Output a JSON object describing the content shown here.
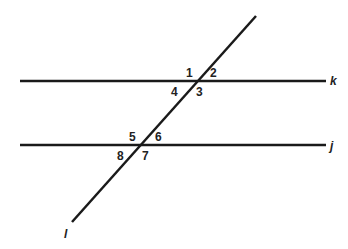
{
  "diagram": {
    "stroke_color": "#1a1a1a",
    "lines": [
      {
        "name": "k",
        "x1": 20,
        "y1": 81,
        "x2": 326,
        "y2": 81,
        "label_x": 330,
        "label_y": 85
      },
      {
        "name": "j",
        "x1": 20,
        "y1": 145,
        "x2": 326,
        "y2": 145,
        "label_x": 330,
        "label_y": 150
      },
      {
        "name": "l",
        "x1": 256,
        "y1": 16,
        "x2": 72,
        "y2": 222,
        "label_x": 64,
        "label_y": 238
      }
    ],
    "angles": [
      {
        "label": "1",
        "x": 186,
        "y": 77
      },
      {
        "label": "2",
        "x": 210,
        "y": 77
      },
      {
        "label": "4",
        "x": 171,
        "y": 96
      },
      {
        "label": "3",
        "x": 196,
        "y": 96
      },
      {
        "label": "5",
        "x": 129,
        "y": 141
      },
      {
        "label": "6",
        "x": 155,
        "y": 141
      },
      {
        "label": "8",
        "x": 117,
        "y": 160
      },
      {
        "label": "7",
        "x": 142,
        "y": 160
      }
    ]
  }
}
